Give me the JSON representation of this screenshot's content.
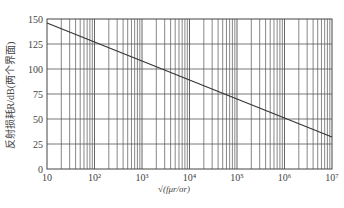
{
  "chart_data": {
    "type": "line",
    "title": "",
    "xlabel": "√(fμr/σr)",
    "ylabel": "反射损耗R/dB(两个界面)",
    "xscale": "log",
    "xlim": [
      10,
      10000000
    ],
    "ylim": [
      0,
      150
    ],
    "x_ticks": [
      "10",
      "10²",
      "10³",
      "10⁴",
      "10⁵",
      "10⁶",
      "10⁷"
    ],
    "y_ticks": [
      "0",
      "25",
      "50",
      "75",
      "100",
      "125",
      "150"
    ],
    "grid": true,
    "minor_grid_x": true,
    "legend": null,
    "series": [
      {
        "name": "R",
        "x": [
          10,
          100,
          1000,
          10000,
          100000,
          1000000,
          10000000
        ],
        "values": [
          146,
          127,
          108,
          89,
          70,
          51,
          32
        ]
      }
    ]
  },
  "colors": {
    "line": "#333333",
    "grid": "#555555",
    "text": "#444444"
  }
}
